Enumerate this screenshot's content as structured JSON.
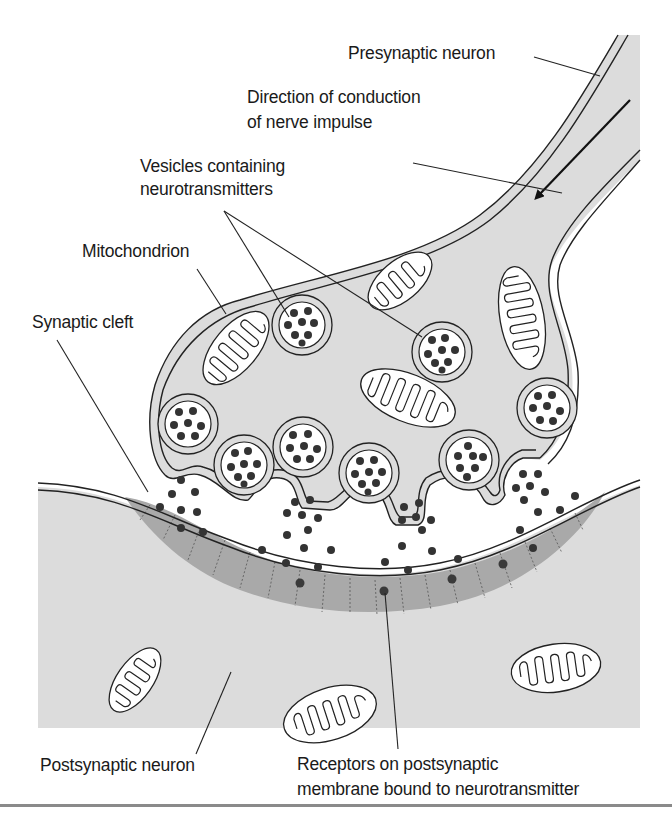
{
  "figure": {
    "colors": {
      "background": "#ffffff",
      "cytoplasm": "#dcdcdc",
      "postsynaptic_density": "#a9a9a9",
      "outline": "#222222",
      "neurotransmitter": "#333333",
      "divider": "#8a8a8a"
    }
  },
  "labels": {
    "presynaptic_neuron": "Presynaptic neuron",
    "direction_line1": "Direction of conduction",
    "direction_line2": "of nerve impulse",
    "vesicles_line1": "Vesicles containing",
    "vesicles_line2": "neurotransmitters",
    "mitochondrion": "Mitochondrion",
    "synaptic_cleft": "Synaptic cleft",
    "postsynaptic_neuron": "Postsynaptic neuron",
    "receptors_line1": "Receptors on postsynaptic",
    "receptors_line2": "membrane bound to neurotransmitter"
  },
  "icons": {
    "impulse_arrow": "arrow-down-left-icon"
  },
  "structures": {
    "vesicle_count": 9,
    "fusing_vesicles": 4,
    "presynaptic_mitochondria": 4,
    "postsynaptic_mitochondria": 3,
    "receptors": 4
  }
}
